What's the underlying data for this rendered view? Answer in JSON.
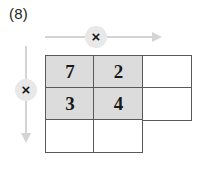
{
  "problem": {
    "label": "(8)"
  },
  "operators": {
    "row_operator": {
      "symbol": "×",
      "name": "multiply",
      "direction": "right",
      "badge_color": "#e8e8e8",
      "arrow_color": "#d4d4d4"
    },
    "column_operator": {
      "symbol": "×",
      "name": "multiply",
      "direction": "down",
      "badge_color": "#e8e8e8",
      "arrow_color": "#d4d4d4"
    }
  },
  "grid": {
    "rows": 3,
    "columns": 3,
    "border_color": "#58595b",
    "shaded_color": "#dcdcdc",
    "empty_color": "#ffffff",
    "cells": [
      [
        {
          "value": "7",
          "shaded": true,
          "present": true
        },
        {
          "value": "2",
          "shaded": true,
          "present": true
        },
        {
          "value": "",
          "shaded": false,
          "present": true
        }
      ],
      [
        {
          "value": "3",
          "shaded": true,
          "present": true
        },
        {
          "value": "4",
          "shaded": true,
          "present": true
        },
        {
          "value": "",
          "shaded": false,
          "present": true
        }
      ],
      [
        {
          "value": "",
          "shaded": false,
          "present": true
        },
        {
          "value": "",
          "shaded": false,
          "present": true
        },
        {
          "value": "",
          "shaded": false,
          "present": false
        }
      ]
    ]
  }
}
